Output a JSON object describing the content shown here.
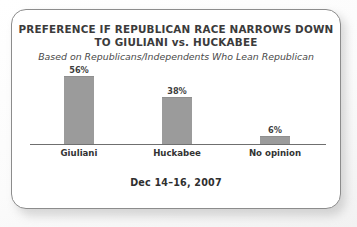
{
  "card": {
    "border_color": "#8c8c8c",
    "background": "#ffffff"
  },
  "chart_data": {
    "type": "bar",
    "title": "PREFERENCE IF REPUBLICAN RACE NARROWS DOWN TO GIULIANI vs. HUCKABEE",
    "title_lines": [
      "PREFERENCE IF REPUBLICAN RACE NARROWS DOWN",
      "TO GIULIANI vs. HUCKABEE"
    ],
    "subtitle": "Based on Republicans/Independents Who Lean Republican",
    "categories": [
      "Giuliani",
      "Huckabee",
      "No opinion"
    ],
    "values": [
      56,
      38,
      6
    ],
    "value_labels": [
      "56%",
      "38%",
      "6%"
    ],
    "xlabel": "",
    "ylabel": "",
    "ylim": [
      0,
      60
    ],
    "grid": false,
    "legend": false,
    "bar_color": "#9b9b9b",
    "axis_color": "#6f6f6f",
    "footer": "Dec 14–16, 2007"
  }
}
